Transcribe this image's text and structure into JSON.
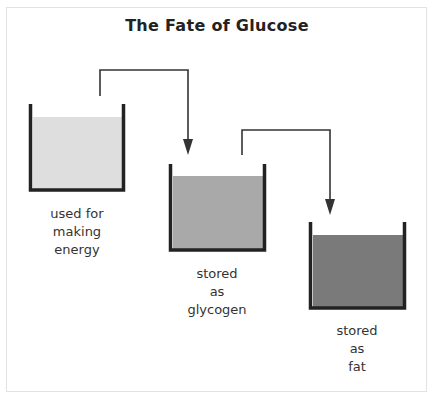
{
  "title": "The Fate of Glucose",
  "colors": {
    "beaker_wall": "#222222",
    "arrow": "#333333",
    "liquid_light": "#dedede",
    "liquid_medium": "#a9a9a9",
    "liquid_dark": "#7a7a7a"
  },
  "beakers": [
    {
      "name": "energy",
      "lines": [
        "used for",
        "making",
        "energy"
      ]
    },
    {
      "name": "glycogen",
      "lines": [
        "stored",
        "as",
        "glycogen"
      ]
    },
    {
      "name": "fat",
      "lines": [
        "stored",
        "as",
        "fat"
      ]
    }
  ],
  "arrows": [
    {
      "from": "energy",
      "to": "glycogen"
    },
    {
      "from": "glycogen",
      "to": "fat"
    }
  ]
}
